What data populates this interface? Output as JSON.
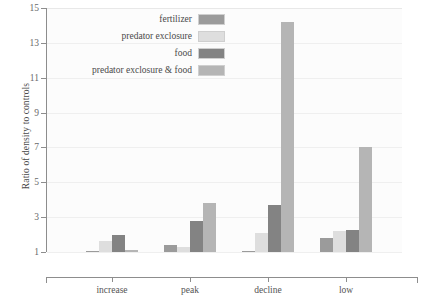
{
  "chart_data": {
    "type": "bar",
    "title": "",
    "subtitle": "",
    "xlabel": "",
    "ylabel": "Ratio of density to controls",
    "categories": [
      "increase",
      "peak",
      "decline",
      "low"
    ],
    "series": [
      {
        "name": "fertilizer",
        "color": "#9b9b9b",
        "values": [
          1.05,
          1.4,
          1.0,
          1.8
        ]
      },
      {
        "name": "predator exclosure",
        "color": "#dedede",
        "values": [
          1.65,
          1.3,
          2.1,
          2.2
        ]
      },
      {
        "name": "food",
        "color": "#838383",
        "values": [
          2.0,
          2.75,
          3.7,
          2.25
        ]
      },
      {
        "name": "predator exclosure & food",
        "color": "#b5b5b5",
        "values": [
          1.1,
          3.8,
          14.2,
          7.0
        ]
      }
    ],
    "ylim": [
      1,
      15
    ],
    "yticks": [
      1,
      3,
      5,
      7,
      9,
      11,
      13,
      15
    ],
    "ytick_labels": [
      "1",
      "3",
      "5",
      "7",
      "9",
      "11",
      "13",
      "15"
    ],
    "grid": true,
    "grid_axis": "y",
    "legend_position": "inside-top-center",
    "baseline_value": 1
  },
  "legend": {
    "entries": [
      {
        "label": "fertilizer"
      },
      {
        "label": "predator exclosure"
      },
      {
        "label": "food"
      },
      {
        "label": "predator exclosure & food"
      }
    ]
  },
  "axes": {
    "y_title": "Ratio of density to controls",
    "y_tick_labels": [
      "15",
      "13",
      "11",
      "9",
      "7",
      "5",
      "3",
      "1"
    ],
    "x_tick_labels": [
      "increase",
      "peak",
      "decline",
      "low"
    ]
  }
}
